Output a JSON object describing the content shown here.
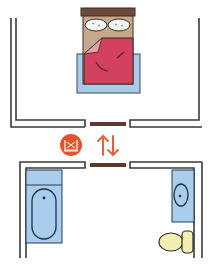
{
  "diagram": {
    "type": "floor-plan",
    "rooms": [
      {
        "name": "bedroom",
        "furniture": [
          "double bed with two pillows",
          "red duvet",
          "blue bed base"
        ]
      },
      {
        "name": "bathroom",
        "furniture": [
          "bathtub",
          "washbasin",
          "toilet"
        ]
      }
    ],
    "connectors": [
      {
        "name": "bedroom-door",
        "position": "bottom wall of bedroom"
      },
      {
        "name": "bathroom-door",
        "position": "top wall of bathroom"
      }
    ],
    "hallway": {
      "icon": "bathroom-sign-icon",
      "arrows": "up-down-arrows-icon",
      "glyphs": {
        "arrow_up": "↑",
        "arrow_down": "↓"
      }
    },
    "colors": {
      "wall": "#3a3a3a",
      "door": "#5a3a2a",
      "bed_headboard": "#6b4a3a",
      "bed_frame": "#c8a88a",
      "pillow": "#f4f4f0",
      "duvet": "#d2415e",
      "duvet_fold": "#e6a0b0",
      "bed_base": "#a8cbe8",
      "fixture_blue": "#a9cdec",
      "toilet": "#f4efb0",
      "icon_circle": "#e2552b",
      "arrow": "#e4613a"
    }
  }
}
